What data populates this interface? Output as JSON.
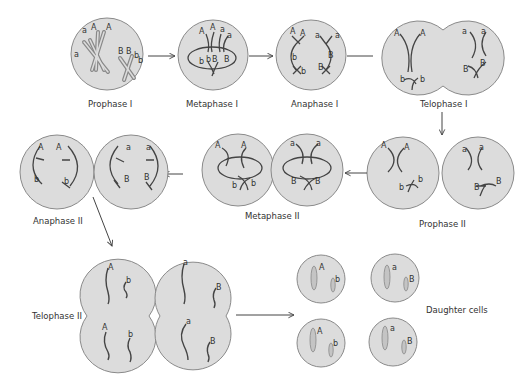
{
  "diagram": {
    "colors": {
      "cell_fill": "#dcdcdc",
      "cell_stroke": "#8a8a8a",
      "chromosome": "#444444",
      "arrow": "#444444",
      "background": "#ffffff"
    },
    "stages": [
      {
        "id": "prophase-1",
        "label": "Prophase I",
        "alleles": [
          "a",
          "A",
          "A",
          "a",
          "B",
          "B",
          "b",
          "b"
        ]
      },
      {
        "id": "metaphase-1",
        "label": "Metaphase I",
        "alleles": [
          "A",
          "A",
          "a",
          "a",
          "b",
          "b",
          "B",
          "B"
        ]
      },
      {
        "id": "anaphase-1",
        "label": "Anaphase I",
        "alleles": [
          "A",
          "A",
          "b",
          "b",
          "a",
          "a",
          "B",
          "B"
        ]
      },
      {
        "id": "telophase-1",
        "label": "Telophase I",
        "alleles": [
          "A",
          "A",
          "b",
          "b",
          "a",
          "a",
          "B",
          "B"
        ]
      },
      {
        "id": "prophase-2",
        "label": "Prophase II",
        "alleles": [
          "A",
          "A",
          "b",
          "b",
          "a",
          "a",
          "B",
          "B"
        ]
      },
      {
        "id": "metaphase-2",
        "label": "Metaphase II",
        "alleles": [
          "A",
          "A",
          "b",
          "b",
          "a",
          "a",
          "B",
          "B"
        ]
      },
      {
        "id": "anaphase-2",
        "label": "Anaphase II",
        "alleles": [
          "A",
          "A",
          "b",
          "b",
          "a",
          "a",
          "B",
          "B"
        ]
      },
      {
        "id": "telophase-2",
        "label": "Telophase II",
        "alleles": [
          "A",
          "b",
          "A",
          "b",
          "a",
          "B",
          "a",
          "B"
        ]
      },
      {
        "id": "daughter-cells",
        "label": "Daughter cells",
        "cells": [
          {
            "alleles": [
              "A",
              "b"
            ]
          },
          {
            "alleles": [
              "a",
              "B"
            ]
          },
          {
            "alleles": [
              "A",
              "b"
            ]
          },
          {
            "alleles": [
              "a",
              "B"
            ]
          }
        ]
      }
    ],
    "flow": [
      "Prophase I",
      "Metaphase I",
      "Anaphase I",
      "Telophase I",
      "Prophase II",
      "Metaphase II",
      "Anaphase II",
      "Telophase II",
      "Daughter cells"
    ]
  }
}
